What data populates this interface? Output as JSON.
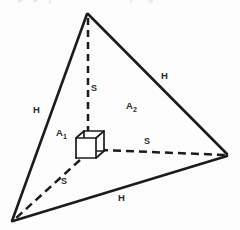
{
  "figure": {
    "canvas": {
      "width": 240,
      "height": 230,
      "background": "#fdfdfd"
    },
    "ink_color": "#1c1c1c",
    "label_color": "#2b2b2b",
    "vertices": {
      "apex": {
        "x": 87,
        "y": 13
      },
      "bottom_left": {
        "x": 12,
        "y": 222
      },
      "right": {
        "x": 228,
        "y": 155
      },
      "center": {
        "x": 90,
        "y": 148
      }
    },
    "solid_edges": [
      {
        "name": "left-edge",
        "from": "apex",
        "to": "bottom_left",
        "label": "H"
      },
      {
        "name": "right-edge",
        "from": "apex",
        "to": "right",
        "label": "H"
      },
      {
        "name": "bottom-edge",
        "from": "bottom_left",
        "to": "right",
        "label": "H"
      }
    ],
    "dashed_edges": [
      {
        "name": "vertical-axis",
        "from": "center",
        "to": "apex",
        "label": "S"
      },
      {
        "name": "right-axis",
        "from": "center",
        "to": "right",
        "label": "S"
      },
      {
        "name": "lower-left-axis",
        "from": "center",
        "to": "bottom_left",
        "label": "S"
      }
    ],
    "cube": {
      "name": "inscribed-cube",
      "front_face": {
        "x": 76,
        "y": 138,
        "width": 20,
        "height": 20
      },
      "back_face": {
        "x": 84,
        "y": 131,
        "width": 20,
        "height": 20
      }
    },
    "labels": [
      {
        "id": "h-left",
        "text": "H",
        "x": 33,
        "y": 105,
        "kind": "edge-length"
      },
      {
        "id": "h-right",
        "text": "H",
        "x": 161,
        "y": 71,
        "kind": "edge-length"
      },
      {
        "id": "h-bottom",
        "text": "H",
        "x": 118,
        "y": 193,
        "kind": "edge-length"
      },
      {
        "id": "s-top",
        "text": "S",
        "x": 91,
        "y": 84,
        "kind": "segment-length"
      },
      {
        "id": "s-right",
        "text": "S",
        "x": 144,
        "y": 137,
        "kind": "segment-length"
      },
      {
        "id": "s-lower",
        "text": "S",
        "x": 61,
        "y": 177,
        "kind": "segment-length"
      }
    ],
    "area_labels": [
      {
        "id": "a1",
        "base": "A",
        "sub": "1",
        "x": 56,
        "y": 128,
        "kind": "area"
      },
      {
        "id": "a2",
        "base": "A",
        "sub": "2",
        "x": 126,
        "y": 101,
        "kind": "area"
      }
    ],
    "top_artifacts": [
      {
        "text": "p",
        "x": 18
      },
      {
        "text": "p",
        "x": 33
      },
      {
        "text": "j",
        "x": 49
      },
      {
        "text": "y",
        "x": 129
      },
      {
        "text": "g",
        "x": 148
      }
    ]
  }
}
